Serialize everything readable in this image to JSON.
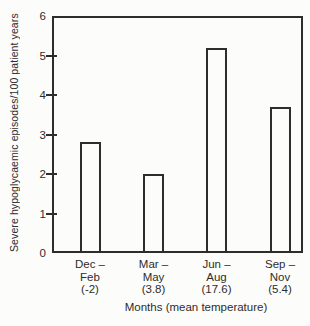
{
  "colors": {
    "background": "#fcfcfb",
    "ink": "#2e2d2b"
  },
  "chart_data": {
    "type": "bar",
    "title": "",
    "ylabel": "Severe hypoglycaemic episodes/100 patient years",
    "xlabel": "Months (mean temperature)",
    "ylim": [
      0,
      6
    ],
    "yticks": [
      0,
      1,
      2,
      3,
      4,
      5,
      6
    ],
    "grid": false,
    "legend": false,
    "bar_fill": "#fcfcfb",
    "bar_stroke": "#2e2d2b",
    "categories": [
      "Dec – Feb",
      "Mar – May",
      "Jun – Aug",
      "Sep – Nov"
    ],
    "category_label_lines": [
      [
        "Dec –",
        "Feb",
        "(-2)"
      ],
      [
        "Mar –",
        "May",
        "(3.8)"
      ],
      [
        "Jun –",
        "Aug",
        "(17.6)"
      ],
      [
        "Sep –",
        "Nov",
        "(5.4)"
      ]
    ],
    "mean_temperatures_c": [
      -2,
      3.8,
      17.6,
      5.4
    ],
    "values": [
      2.8,
      2.0,
      5.2,
      3.7
    ]
  }
}
